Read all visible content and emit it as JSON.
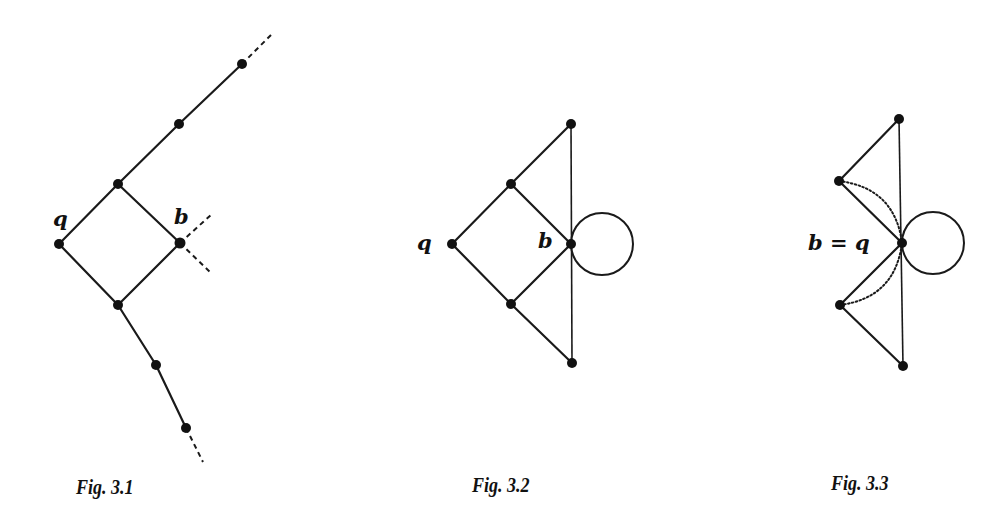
{
  "figures": [
    {
      "id": "fig-3-1",
      "caption": "Fig. 3.1",
      "labels": {
        "q": "q",
        "b": "b"
      },
      "description": "Infinite ladder-like graph: diamond q–upper–b–lower with rays extending up-right and down-right; dashed continuations at ends and at b"
    },
    {
      "id": "fig-3-2",
      "caption": "Fig. 3.2",
      "labels": {
        "q": "q",
        "b": "b"
      },
      "description": "Finite quotient: diamond with outer triangle edges meeting a vertical edge through b, with a loop at b"
    },
    {
      "id": "fig-3-3",
      "caption": "Fig. 3.3",
      "labels": {
        "bq": "b = q"
      },
      "description": "Further identification b = q: two triangles sharing vertical edge, loop at b=q, dotted arcs showing identified edges"
    }
  ],
  "colors": {
    "ink": "#111111",
    "paper": "#ffffff"
  }
}
